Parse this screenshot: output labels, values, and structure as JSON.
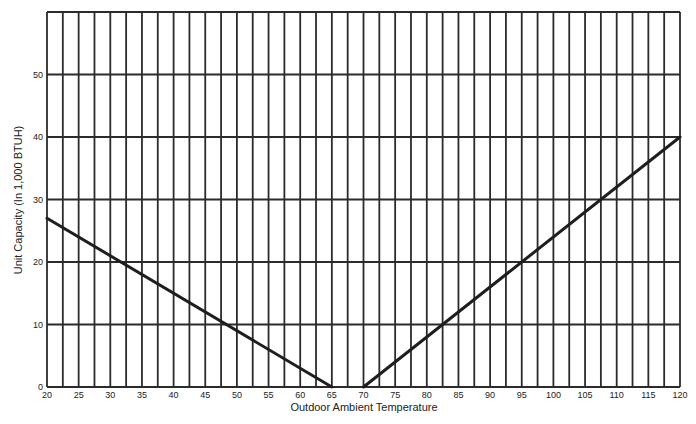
{
  "chart_data": {
    "type": "line",
    "title": "",
    "xlabel": "Outdoor Ambient Temperature",
    "ylabel": "Unit Capacity (In 1,000 BTUH)",
    "xlim": [
      20,
      120
    ],
    "ylim": [
      0,
      60
    ],
    "x_ticks": [
      20,
      25,
      30,
      35,
      40,
      45,
      50,
      55,
      60,
      65,
      70,
      75,
      80,
      85,
      90,
      95,
      100,
      105,
      110,
      115,
      120
    ],
    "x_minor_grid_step": 2.5,
    "y_ticks": [
      0,
      10,
      20,
      30,
      40,
      50
    ],
    "y_grid": [
      0,
      10,
      20,
      30,
      40,
      50,
      60
    ],
    "grid": true,
    "legend": null,
    "series": [
      {
        "name": "heating-capacity-line",
        "points": [
          [
            20,
            27
          ],
          [
            65,
            0
          ]
        ]
      },
      {
        "name": "cooling-capacity-line",
        "points": [
          [
            70,
            0
          ],
          [
            120,
            40
          ]
        ]
      }
    ]
  },
  "style": {
    "grid_color": "#2b2b2b",
    "line_color": "#1e1e1e",
    "text_color": "#222222"
  }
}
